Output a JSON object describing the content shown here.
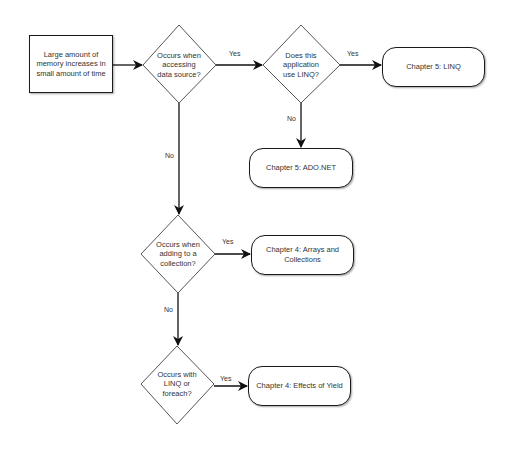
{
  "flowchart": {
    "start": {
      "text": "Large amount of memory increases in small amount of time"
    },
    "decisions": [
      {
        "id": "d1",
        "text": "Occurs when accessing data source?"
      },
      {
        "id": "d2",
        "text": "Does this application use LINQ?"
      },
      {
        "id": "d3",
        "text": "Occurs when adding to a collection?"
      },
      {
        "id": "d4",
        "text": "Occurs with LINQ or foreach?"
      }
    ],
    "outcomes": [
      {
        "id": "o1",
        "text": "Chapter 5: LINQ"
      },
      {
        "id": "o2",
        "text": "Chapter 5: ADO.NET"
      },
      {
        "id": "o3",
        "text": "Chapter 4: Arrays and Collections"
      },
      {
        "id": "o4",
        "text": "Chapter 4: Effects of Yield"
      }
    ],
    "edge_labels": {
      "d1_yes": "Yes",
      "d1_no": "No",
      "d2_yes": "Yes",
      "d2_no": "No",
      "d3_yes": "Yes",
      "d3_no": "No",
      "d4_yes": "Yes"
    },
    "colors": {
      "stroke": "#1a1a1a",
      "diamond_stroke": "#555555",
      "fill": "#ffffff",
      "text": "#333333"
    }
  }
}
